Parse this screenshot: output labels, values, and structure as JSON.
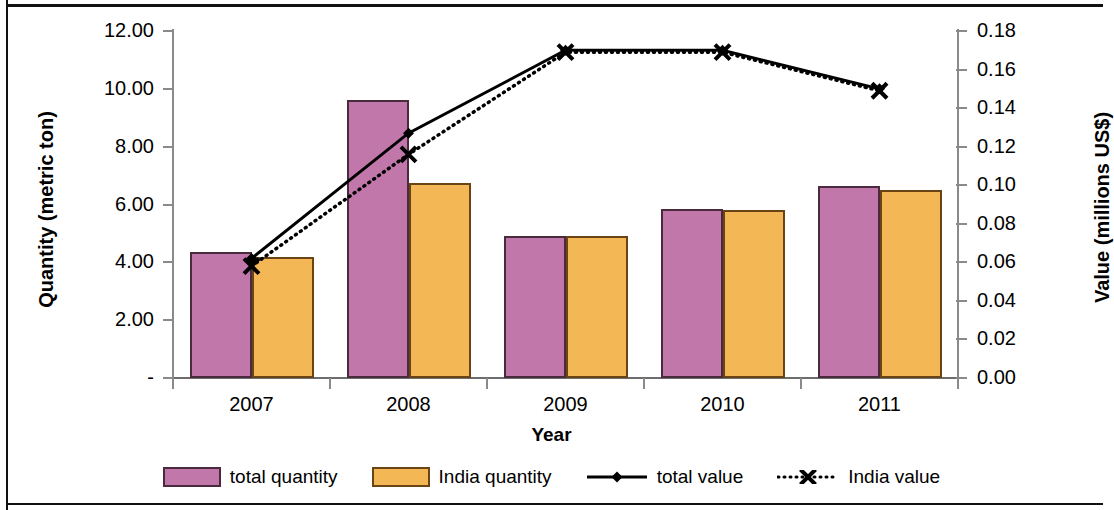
{
  "chart_data": {
    "type": "bar",
    "title": "",
    "xlabel": "Year",
    "ylabel": "Quantity (metric ton)",
    "y2label": "Value (millions US$)",
    "categories": [
      "2007",
      "2008",
      "2009",
      "2010",
      "2011"
    ],
    "ylim": [
      0,
      12
    ],
    "y2lim": [
      0,
      0.18
    ],
    "yticks": [
      "-",
      "2.00",
      "4.00",
      "6.00",
      "8.00",
      "10.00",
      "12.00"
    ],
    "ytick_values": [
      0,
      2,
      4,
      6,
      8,
      10,
      12
    ],
    "y2ticks": [
      "0.00",
      "0.02",
      "0.04",
      "0.06",
      "0.08",
      "0.10",
      "0.12",
      "0.14",
      "0.16",
      "0.18"
    ],
    "y2tick_values": [
      0,
      0.02,
      0.04,
      0.06,
      0.08,
      0.1,
      0.12,
      0.14,
      0.16,
      0.18
    ],
    "grid": false,
    "legend_position": "bottom",
    "series": [
      {
        "name": "total quantity",
        "kind": "bar",
        "axis": "left",
        "color": "#c277ab",
        "values": [
          4.35,
          9.6,
          4.9,
          5.85,
          6.65
        ]
      },
      {
        "name": "India quantity",
        "kind": "bar",
        "axis": "left",
        "color": "#f3b755",
        "values": [
          4.2,
          6.75,
          4.9,
          5.8,
          6.5
        ]
      },
      {
        "name": "total value",
        "kind": "line",
        "axis": "right",
        "color": "#000000",
        "style": "solid",
        "marker": "diamond",
        "values": [
          0.062,
          0.127,
          0.17,
          0.17,
          0.15
        ]
      },
      {
        "name": "India value",
        "kind": "line",
        "axis": "right",
        "color": "#000000",
        "style": "dotted",
        "marker": "x",
        "values": [
          0.058,
          0.116,
          0.169,
          0.169,
          0.149
        ]
      }
    ]
  },
  "legend": {
    "items": [
      {
        "label": "total quantity",
        "glyph": "swatch-pink"
      },
      {
        "label": "India quantity",
        "glyph": "swatch-orange"
      },
      {
        "label": "total value",
        "glyph": "line-solid-diamond"
      },
      {
        "label": "India value",
        "glyph": "line-dotted-x"
      }
    ]
  }
}
